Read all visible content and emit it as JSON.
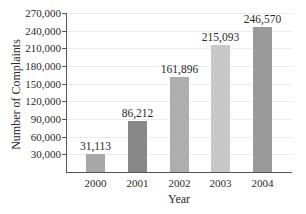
{
  "chart_data": {
    "type": "bar",
    "title": "",
    "xlabel": "Year",
    "ylabel": "Number of Complaints",
    "categories": [
      "2000",
      "2001",
      "2002",
      "2003",
      "2004"
    ],
    "values": [
      31113,
      86212,
      161896,
      215093,
      246570
    ],
    "value_labels": [
      "31,113",
      "86,212",
      "161,896",
      "215,093",
      "246,570"
    ],
    "bar_colors": [
      "#a8a8a8",
      "#888888",
      "#aeaeae",
      "#c8c8c8",
      "#9a9a9a"
    ],
    "y_ticks": [
      "30,000",
      "60,000",
      "90,000",
      "120,000",
      "150,000",
      "180,000",
      "210,000",
      "240,000",
      "270,000"
    ],
    "ylim": [
      0,
      270000
    ],
    "grid": true,
    "legend": null
  }
}
